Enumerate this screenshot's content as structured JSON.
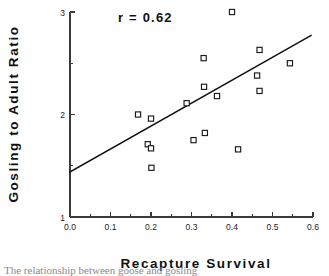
{
  "figure": {
    "width": 329,
    "height": 276,
    "background": "#ffffff",
    "ink_color": "#1a1a1a"
  },
  "annotation_text": "r  =  0.62",
  "caption_fragment": "The relationship between goose and gosling",
  "chart_data": {
    "type": "scatter",
    "title": "",
    "xlabel": "Recapture  Survival",
    "ylabel": "Gosling  to  Adult  Ratio",
    "xlim": [
      0.0,
      0.6
    ],
    "ylim": [
      1.0,
      3.0
    ],
    "grid": false,
    "legend": "none",
    "correlation_label": "r  =  0.62",
    "correlation_value": 0.62,
    "x_ticks_major": [
      0.0,
      0.1,
      0.2,
      0.3,
      0.4,
      0.5,
      0.6
    ],
    "x_ticklabels": [
      "0.0",
      "0.1",
      "0.2",
      "0.3",
      "0.4",
      "0.5",
      "0.6"
    ],
    "x_ticks_minor": [
      0.05,
      0.15,
      0.25,
      0.35,
      0.45,
      0.55
    ],
    "y_ticks_major": [
      1,
      2,
      3
    ],
    "y_ticklabels": [
      "1",
      "2",
      "3"
    ],
    "y_ticks_minor": [
      1.5,
      2.5
    ],
    "marker_style": "open-square",
    "points": [
      {
        "x": 0.168,
        "y": 2.0
      },
      {
        "x": 0.2,
        "y": 1.96
      },
      {
        "x": 0.192,
        "y": 1.71
      },
      {
        "x": 0.2,
        "y": 1.67
      },
      {
        "x": 0.201,
        "y": 1.48
      },
      {
        "x": 0.288,
        "y": 2.11
      },
      {
        "x": 0.305,
        "y": 1.75
      },
      {
        "x": 0.33,
        "y": 2.55
      },
      {
        "x": 0.331,
        "y": 2.27
      },
      {
        "x": 0.333,
        "y": 1.82
      },
      {
        "x": 0.363,
        "y": 2.18
      },
      {
        "x": 0.4,
        "y": 3.0
      },
      {
        "x": 0.415,
        "y": 1.66
      },
      {
        "x": 0.462,
        "y": 2.38
      },
      {
        "x": 0.468,
        "y": 2.63
      },
      {
        "x": 0.468,
        "y": 2.23
      },
      {
        "x": 0.543,
        "y": 2.5
      }
    ],
    "fit_line": {
      "x_start": 0.0,
      "y_start": 1.44,
      "x_end": 0.595,
      "y_end": 2.77
    }
  }
}
